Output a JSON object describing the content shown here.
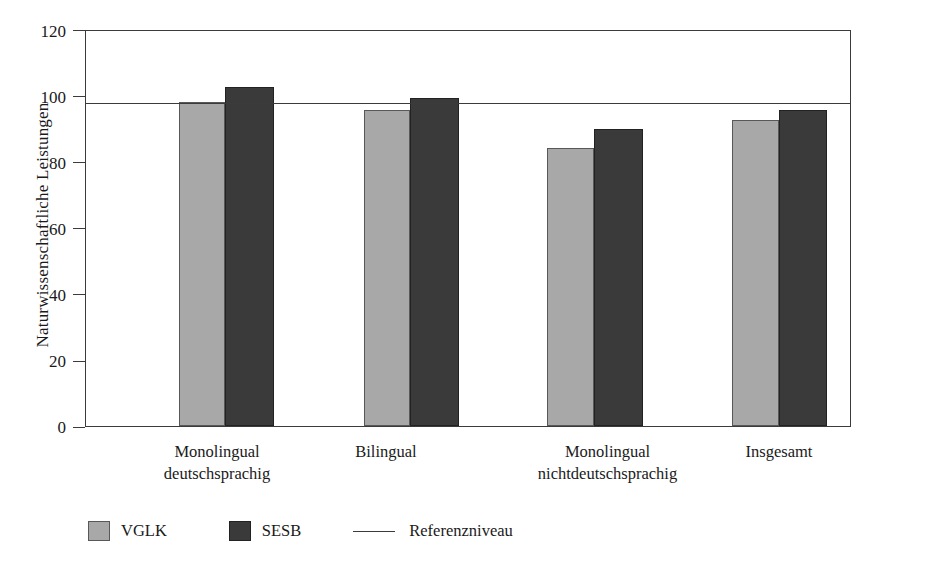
{
  "chart_data": {
    "type": "bar",
    "title": "",
    "xlabel": "",
    "ylabel": "Naturwissenschaftliche Leistungen",
    "ylim": [
      0,
      120
    ],
    "yticks": [
      0,
      20,
      40,
      60,
      80,
      100,
      120
    ],
    "ytick_labels": [
      "0",
      "20",
      "40",
      "60",
      "80",
      "100",
      "120"
    ],
    "grid": false,
    "legend_position": "bottom-left",
    "categories": [
      "Monolingual deutschsprachig",
      "Bilingual",
      "Monolingual nichtdeutschsprachig",
      "Insgesamt"
    ],
    "category_lines": [
      [
        "Monolingual",
        "deutschsprachig"
      ],
      [
        "Bilingual",
        ""
      ],
      [
        "Monolingual",
        "nichtdeutschsprachig"
      ],
      [
        "Insgesamt",
        ""
      ]
    ],
    "series": [
      {
        "name": "VGLK",
        "color": "#a8a8a8",
        "values": [
          98.5,
          96,
          84.5,
          93
        ]
      },
      {
        "name": "SESB",
        "color": "#3a3a3a",
        "values": [
          103,
          99.8,
          90.3,
          96
        ]
      }
    ],
    "reference_line": {
      "name": "Referenzniveau",
      "value": 98,
      "color": "#3b3b3b"
    },
    "legend": [
      {
        "label": "VGLK",
        "marker": "swatch-gray"
      },
      {
        "label": "SESB",
        "marker": "swatch-dark"
      },
      {
        "label": "Referenzniveau",
        "marker": "line"
      }
    ]
  }
}
